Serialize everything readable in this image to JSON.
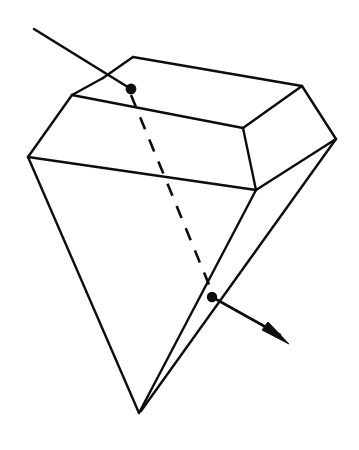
{
  "figure": {
    "title": "Refraction through a gem-shaped solid",
    "background_color": "#ffffff",
    "stroke_color": "#0d0d0d",
    "canvas": {
      "width": 359,
      "height": 450
    }
  },
  "geometry": {
    "vertices": {
      "crown_top_left": [
        103,
        78
      ],
      "crown_top_apex": [
        133,
        57
      ],
      "crown_top_right": [
        302,
        86
      ],
      "table_left": [
        72,
        95
      ],
      "table_right_front": [
        243,
        128
      ],
      "girdle_left": [
        28,
        157
      ],
      "girdle_right_front": [
        256,
        190
      ],
      "girdle_far_right": [
        336,
        139
      ],
      "pavilion_apex": [
        139,
        413
      ]
    },
    "solid_edges": [
      {
        "name": "crown-back-left-edge",
        "points": "103,78 133,57"
      },
      {
        "name": "crown-back-top-edge",
        "points": "133,57 302,86"
      },
      {
        "name": "table-left-edge",
        "points": "103,78 72,95"
      },
      {
        "name": "table-front-edge",
        "points": "72,95 243,128"
      },
      {
        "name": "table-right-edge",
        "points": "243,128 302,86"
      },
      {
        "name": "crown-left-facet-edge",
        "points": "72,95 28,157"
      },
      {
        "name": "girdle-front-edge",
        "points": "28,157 256,190"
      },
      {
        "name": "crown-front-right-facet-edge",
        "points": "243,128 256,190"
      },
      {
        "name": "crown-right-facet-edge",
        "points": "302,86 336,139"
      },
      {
        "name": "girdle-right-edge",
        "points": "336,139 256,190"
      },
      {
        "name": "pavilion-left-edge",
        "points": "28,157 139,413"
      },
      {
        "name": "pavilion-front-edge",
        "points": "256,190 139,413"
      },
      {
        "name": "pavilion-right-edge",
        "points": "336,139 141,411"
      }
    ],
    "hidden_edge": {
      "name": "internal-ray-path",
      "points": "131,95 212,292"
    }
  },
  "rays": {
    "incident": {
      "name": "incident-ray",
      "label": "incoming ray",
      "start": [
        34,
        29
      ],
      "end": [
        131,
        89
      ],
      "has_arrow_head": false
    },
    "exit": {
      "name": "exit-ray",
      "label": "outgoing ray",
      "start": [
        212,
        297
      ],
      "end": [
        280,
        335
      ],
      "has_arrow_head": true,
      "arrow_head_points": "289,344 262,330 268,322"
    }
  },
  "points": [
    {
      "name": "entry-point",
      "label": "entry point on top facet",
      "cx": 131,
      "cy": 89,
      "r": 5.4
    },
    {
      "name": "exit-point",
      "label": "exit point on pavilion facet",
      "cx": 212,
      "cy": 297,
      "r": 5.2
    }
  ]
}
